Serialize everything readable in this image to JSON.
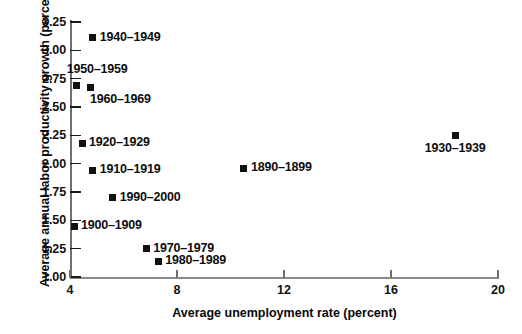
{
  "chart_data": {
    "type": "scatter",
    "title": "",
    "xlabel": "Average unemployment rate (percent)",
    "ylabel": "Average annual labor productivity growth (percent)",
    "xlim": [
      4,
      20
    ],
    "ylim": [
      1.0,
      3.25
    ],
    "xticks": [
      "4",
      "8",
      "12",
      "16",
      "20"
    ],
    "xtick_values": [
      4,
      8,
      12,
      16,
      20
    ],
    "yticks": [
      "1.00",
      "1.25",
      "1.50",
      "1.75",
      "2.00",
      "2.25",
      "2.50",
      "2.75",
      "3.00",
      "3.25"
    ],
    "ytick_values": [
      1.0,
      1.25,
      1.5,
      1.75,
      2.0,
      2.25,
      2.5,
      2.75,
      3.0,
      3.25
    ],
    "grid": false,
    "legend": "none",
    "marker": "filled-square",
    "marker_color": "#111111",
    "points": [
      {
        "label": "1890–1899",
        "x": 10.5,
        "y": 1.96,
        "label_pos": "right"
      },
      {
        "label": "1900–1909",
        "x": 4.15,
        "y": 1.45,
        "label_pos": "right"
      },
      {
        "label": "1910–1919",
        "x": 4.85,
        "y": 1.94,
        "label_pos": "right"
      },
      {
        "label": "1920–1929",
        "x": 4.45,
        "y": 2.18,
        "label_pos": "right"
      },
      {
        "label": "1930–1939",
        "x": 18.4,
        "y": 2.25,
        "label_pos": "below-center"
      },
      {
        "label": "1940–1949",
        "x": 4.85,
        "y": 3.11,
        "label_pos": "right"
      },
      {
        "label": "1950–1959",
        "x": 4.25,
        "y": 2.69,
        "label_pos": "above"
      },
      {
        "label": "1960–1969",
        "x": 4.75,
        "y": 2.67,
        "label_pos": "below-right"
      },
      {
        "label": "1970–1979",
        "x": 6.85,
        "y": 1.25,
        "label_pos": "right"
      },
      {
        "label": "1980–1989",
        "x": 7.3,
        "y": 1.14,
        "label_pos": "right"
      },
      {
        "label": "1990–2000",
        "x": 5.6,
        "y": 1.7,
        "label_pos": "right"
      }
    ]
  }
}
